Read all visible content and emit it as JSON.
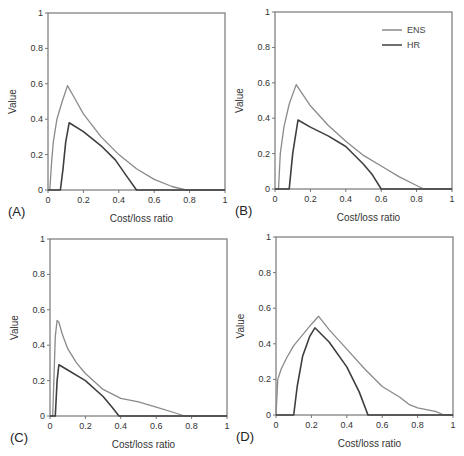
{
  "figure": {
    "colors": {
      "ENS": "#8a8a8a",
      "HR": "#3f3f3f",
      "axis": "#777777"
    },
    "legend": [
      {
        "label": "ENS",
        "color": "#8a8a8a"
      },
      {
        "label": "HR",
        "color": "#3f3f3f"
      }
    ]
  },
  "chart_data": [
    {
      "panel": "(A)",
      "type": "line",
      "xlabel": "Cost/loss ratio",
      "ylabel": "Value",
      "xlim": [
        0,
        1
      ],
      "ylim": [
        0,
        1
      ],
      "xticks": [
        "0",
        "0.2",
        "0.4",
        "0.6",
        "0.8",
        "1"
      ],
      "yticks": [
        "0",
        "0.2",
        "0.4",
        "0.6",
        "0.8",
        "1"
      ],
      "grid": false,
      "legend": false,
      "series": [
        {
          "name": "ENS",
          "x": [
            0,
            0.01,
            0.02,
            0.03,
            0.05,
            0.08,
            0.11,
            0.15,
            0.2,
            0.3,
            0.4,
            0.5,
            0.6,
            0.7,
            0.78,
            1.0
          ],
          "y": [
            0,
            0,
            0.15,
            0.27,
            0.4,
            0.5,
            0.59,
            0.52,
            0.43,
            0.3,
            0.2,
            0.12,
            0.06,
            0.02,
            0,
            0
          ]
        },
        {
          "name": "HR",
          "x": [
            0,
            0.07,
            0.085,
            0.1,
            0.12,
            0.2,
            0.3,
            0.38,
            0.45,
            0.5,
            1.0
          ],
          "y": [
            0,
            0,
            0.12,
            0.27,
            0.38,
            0.33,
            0.25,
            0.17,
            0.07,
            0,
            0
          ]
        }
      ]
    },
    {
      "panel": "(B)",
      "type": "line",
      "xlabel": "Cost/loss ratio",
      "ylabel": "Value",
      "xlim": [
        0,
        1
      ],
      "ylim": [
        0,
        1
      ],
      "xticks": [
        "0",
        "0.2",
        "0.4",
        "0.6",
        "0.8",
        "1"
      ],
      "yticks": [
        "0",
        "0.2",
        "0.4",
        "0.6",
        "0.8",
        "1"
      ],
      "grid": false,
      "legend": true,
      "legend_position": "upper right",
      "series": [
        {
          "name": "ENS",
          "x": [
            0,
            0.02,
            0.03,
            0.05,
            0.08,
            0.12,
            0.2,
            0.3,
            0.4,
            0.5,
            0.6,
            0.7,
            0.8,
            0.84,
            1.0
          ],
          "y": [
            0,
            0,
            0.2,
            0.35,
            0.48,
            0.59,
            0.47,
            0.36,
            0.27,
            0.19,
            0.13,
            0.07,
            0.02,
            0,
            0
          ]
        },
        {
          "name": "HR",
          "x": [
            0,
            0.08,
            0.1,
            0.13,
            0.2,
            0.3,
            0.4,
            0.5,
            0.55,
            0.6,
            1.0
          ],
          "y": [
            0,
            0,
            0.2,
            0.39,
            0.35,
            0.3,
            0.24,
            0.14,
            0.08,
            0,
            0
          ]
        }
      ]
    },
    {
      "panel": "(C)",
      "type": "line",
      "xlabel": "Cost/loss ratio",
      "ylabel": "Value",
      "xlim": [
        0,
        1
      ],
      "ylim": [
        0,
        1
      ],
      "xticks": [
        "0",
        "0.2",
        "0.4",
        "0.6",
        "0.8",
        "1"
      ],
      "yticks": [
        "0",
        "0.2",
        "0.4",
        "0.6",
        "0.8",
        "1"
      ],
      "grid": false,
      "legend": false,
      "series": [
        {
          "name": "ENS",
          "x": [
            0,
            0.015,
            0.03,
            0.04,
            0.05,
            0.07,
            0.1,
            0.15,
            0.2,
            0.3,
            0.4,
            0.5,
            0.6,
            0.7,
            0.76,
            1.0
          ],
          "y": [
            0,
            0,
            0.45,
            0.54,
            0.53,
            0.46,
            0.38,
            0.3,
            0.24,
            0.15,
            0.1,
            0.08,
            0.05,
            0.02,
            0,
            0
          ]
        },
        {
          "name": "HR",
          "x": [
            0,
            0.03,
            0.04,
            0.05,
            0.1,
            0.2,
            0.3,
            0.35,
            0.39,
            1.0
          ],
          "y": [
            0,
            0,
            0.2,
            0.29,
            0.26,
            0.2,
            0.11,
            0.05,
            0,
            0
          ]
        }
      ]
    },
    {
      "panel": "(D)",
      "type": "line",
      "xlabel": "Cost/loss ratio",
      "ylabel": "Value",
      "xlim": [
        0,
        1
      ],
      "ylim": [
        0,
        1
      ],
      "xticks": [
        "0",
        "0.2",
        "0.4",
        "0.6",
        "0.8",
        "1"
      ],
      "yticks": [
        "0",
        "0.2",
        "0.4",
        "0.6",
        "0.8",
        "1"
      ],
      "grid": false,
      "legend": false,
      "series": [
        {
          "name": "ENS",
          "x": [
            0,
            0.01,
            0.03,
            0.06,
            0.1,
            0.15,
            0.2,
            0.24,
            0.3,
            0.4,
            0.5,
            0.6,
            0.7,
            0.75,
            0.8,
            0.9,
            0.95,
            1.0
          ],
          "y": [
            0,
            0.2,
            0.26,
            0.32,
            0.39,
            0.45,
            0.51,
            0.555,
            0.48,
            0.37,
            0.26,
            0.16,
            0.1,
            0.06,
            0.04,
            0.02,
            0,
            0
          ]
        },
        {
          "name": "HR",
          "x": [
            0,
            0.1,
            0.12,
            0.15,
            0.19,
            0.22,
            0.3,
            0.4,
            0.47,
            0.52,
            1.0
          ],
          "y": [
            0,
            0,
            0.16,
            0.33,
            0.44,
            0.49,
            0.41,
            0.27,
            0.13,
            0,
            0
          ]
        }
      ]
    }
  ]
}
